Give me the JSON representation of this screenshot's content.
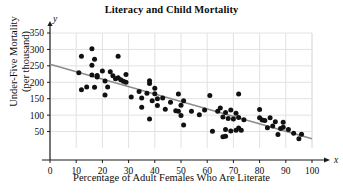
{
  "chart_data": {
    "type": "scatter",
    "title": "Literacy and Child Mortality",
    "xlabel": "Percentage of Adult Females Who Are Literate",
    "ylabel": "Under-Five Mortality\n(per thousand)",
    "x_axis_letter": "x",
    "y_axis_letter": "y",
    "xlim": [
      0,
      100
    ],
    "ylim": [
      0,
      350
    ],
    "xticks": [
      0,
      10,
      20,
      30,
      40,
      50,
      60,
      70,
      80,
      90,
      100
    ],
    "yticks": [
      50,
      100,
      150,
      200,
      250,
      300,
      350
    ],
    "grid": true,
    "legend": "none",
    "point_color": "#111111",
    "trendline_color": "#8c8c8c",
    "grid_color": "#e2e2e2",
    "axis_color": "#1a1a1a",
    "trendline": {
      "x0": 0,
      "y0": 255,
      "x1": 100,
      "y1": 28,
      "description": "negative linear regression line"
    },
    "points": [
      {
        "x": 11,
        "y": 229
      },
      {
        "x": 12,
        "y": 279
      },
      {
        "x": 12,
        "y": 177
      },
      {
        "x": 14,
        "y": 186
      },
      {
        "x": 16,
        "y": 302
      },
      {
        "x": 16,
        "y": 252
      },
      {
        "x": 16,
        "y": 222
      },
      {
        "x": 17,
        "y": 270
      },
      {
        "x": 17,
        "y": 185
      },
      {
        "x": 18,
        "y": 221
      },
      {
        "x": 18,
        "y": 216
      },
      {
        "x": 20,
        "y": 234
      },
      {
        "x": 21,
        "y": 204
      },
      {
        "x": 21,
        "y": 161
      },
      {
        "x": 22,
        "y": 186
      },
      {
        "x": 23,
        "y": 232
      },
      {
        "x": 24,
        "y": 220
      },
      {
        "x": 25,
        "y": 211
      },
      {
        "x": 26,
        "y": 279
      },
      {
        "x": 26,
        "y": 214
      },
      {
        "x": 27,
        "y": 208
      },
      {
        "x": 28,
        "y": 203
      },
      {
        "x": 29,
        "y": 224
      },
      {
        "x": 29,
        "y": 200
      },
      {
        "x": 31,
        "y": 155
      },
      {
        "x": 34,
        "y": 172
      },
      {
        "x": 35,
        "y": 152
      },
      {
        "x": 35,
        "y": 124
      },
      {
        "x": 37,
        "y": 167
      },
      {
        "x": 38,
        "y": 205
      },
      {
        "x": 38,
        "y": 196
      },
      {
        "x": 38,
        "y": 88
      },
      {
        "x": 39,
        "y": 144
      },
      {
        "x": 40,
        "y": 182
      },
      {
        "x": 40,
        "y": 165
      },
      {
        "x": 41,
        "y": 150
      },
      {
        "x": 41,
        "y": 129
      },
      {
        "x": 43,
        "y": 152
      },
      {
        "x": 44,
        "y": 118
      },
      {
        "x": 46,
        "y": 139
      },
      {
        "x": 48,
        "y": 113
      },
      {
        "x": 49,
        "y": 164
      },
      {
        "x": 49,
        "y": 112
      },
      {
        "x": 50,
        "y": 130
      },
      {
        "x": 50,
        "y": 99
      },
      {
        "x": 51,
        "y": 144
      },
      {
        "x": 51,
        "y": 70
      },
      {
        "x": 54,
        "y": 112
      },
      {
        "x": 57,
        "y": 101
      },
      {
        "x": 59,
        "y": 116
      },
      {
        "x": 61,
        "y": 160
      },
      {
        "x": 62,
        "y": 51
      },
      {
        "x": 64,
        "y": 112
      },
      {
        "x": 65,
        "y": 122
      },
      {
        "x": 66,
        "y": 94
      },
      {
        "x": 66,
        "y": 34
      },
      {
        "x": 67,
        "y": 108
      },
      {
        "x": 67,
        "y": 56
      },
      {
        "x": 67,
        "y": 36
      },
      {
        "x": 68,
        "y": 90
      },
      {
        "x": 69,
        "y": 116
      },
      {
        "x": 69,
        "y": 52
      },
      {
        "x": 70,
        "y": 88
      },
      {
        "x": 71,
        "y": 106
      },
      {
        "x": 71,
        "y": 54
      },
      {
        "x": 72,
        "y": 164
      },
      {
        "x": 72,
        "y": 93
      },
      {
        "x": 72,
        "y": 61
      },
      {
        "x": 73,
        "y": 54
      },
      {
        "x": 74,
        "y": 86
      },
      {
        "x": 80,
        "y": 117
      },
      {
        "x": 80,
        "y": 92
      },
      {
        "x": 81,
        "y": 85
      },
      {
        "x": 82,
        "y": 84
      },
      {
        "x": 83,
        "y": 62
      },
      {
        "x": 84,
        "y": 92
      },
      {
        "x": 85,
        "y": 67
      },
      {
        "x": 86,
        "y": 80
      },
      {
        "x": 87,
        "y": 41
      },
      {
        "x": 88,
        "y": 59
      },
      {
        "x": 89,
        "y": 78
      },
      {
        "x": 89,
        "y": 63
      },
      {
        "x": 91,
        "y": 56
      },
      {
        "x": 93,
        "y": 45
      },
      {
        "x": 95,
        "y": 28
      },
      {
        "x": 96,
        "y": 42
      }
    ]
  }
}
